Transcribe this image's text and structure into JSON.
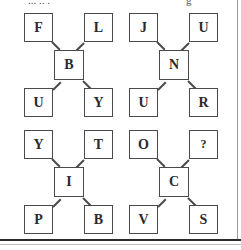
{
  "title_fragment": {
    "left": "... .. .",
    "right": "g"
  },
  "puzzles": [
    {
      "top_left": "F",
      "top_right": "L",
      "center": "B",
      "bottom_left": "U",
      "bottom_right": "Y"
    },
    {
      "top_left": "J",
      "top_right": "U",
      "center": "N",
      "bottom_left": "U",
      "bottom_right": "R"
    },
    {
      "top_left": "Y",
      "top_right": "T",
      "center": "I",
      "bottom_left": "P",
      "bottom_right": "B"
    },
    {
      "top_left": "O",
      "top_right": "?",
      "center": "C",
      "bottom_left": "V",
      "bottom_right": "S"
    }
  ],
  "colors": {
    "border": "#4a4a4a",
    "text": "#2a2a2a",
    "background": "#ffffff"
  }
}
